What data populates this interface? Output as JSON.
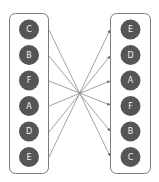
{
  "diagram": {
    "type": "bipartite-mapping",
    "colors": {
      "background": "#ffffff",
      "box_border": "#7a7a7a",
      "node_fill": "#555555",
      "node_text": "#f2f2f2",
      "edge": "#8a8a8a"
    },
    "left_column": {
      "nodes": [
        {
          "label": "C"
        },
        {
          "label": "B"
        },
        {
          "label": "F"
        },
        {
          "label": "A"
        },
        {
          "label": "D"
        },
        {
          "label": "E"
        }
      ]
    },
    "right_column": {
      "nodes": [
        {
          "label": "E"
        },
        {
          "label": "D"
        },
        {
          "label": "A"
        },
        {
          "label": "F"
        },
        {
          "label": "B"
        },
        {
          "label": "C"
        }
      ]
    },
    "edges": [
      {
        "from": "C",
        "to": "C"
      },
      {
        "from": "B",
        "to": "B"
      },
      {
        "from": "F",
        "to": "F"
      },
      {
        "from": "A",
        "to": "A"
      },
      {
        "from": "D",
        "to": "D"
      },
      {
        "from": "E",
        "to": "E"
      }
    ]
  }
}
